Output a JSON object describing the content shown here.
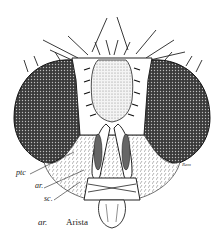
{
  "figure": {
    "labels": [
      {
        "id": "ptc",
        "text": "ptc",
        "x": 16,
        "y": 173
      },
      {
        "id": "ar",
        "text": "ar.",
        "x": 35,
        "y": 186
      },
      {
        "id": "sc",
        "text": "sc.",
        "x": 44,
        "y": 198
      }
    ],
    "signature": "Rem"
  },
  "caption": {
    "abbreviation": "ar.",
    "term": "Arista"
  },
  "colors": {
    "ink": "#222222",
    "background": "#ffffff"
  }
}
